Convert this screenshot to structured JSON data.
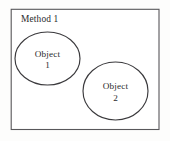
{
  "diagram": {
    "title": "Method 1",
    "boundary": {
      "label": "Method 1",
      "shape": "rectangle"
    },
    "objects": [
      {
        "name": "Object",
        "number": "1",
        "shape": "ellipse"
      },
      {
        "name": "Object",
        "number": "2",
        "shape": "ellipse"
      }
    ],
    "colors": {
      "background": "#fdfdfc",
      "boundary_stroke": "#58575a",
      "ellipse_stroke": "#3b3a3d",
      "text": "#2a2a2c"
    }
  }
}
